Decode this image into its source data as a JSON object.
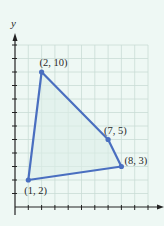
{
  "chart_data": {
    "type": "scatter",
    "title": "",
    "xlabel": "",
    "ylabel": "y",
    "xlim": [
      0,
      10
    ],
    "ylim": [
      0,
      12
    ],
    "grid": true,
    "polygon": true,
    "points": [
      {
        "x": 2,
        "y": 10,
        "label": "(2, 10)"
      },
      {
        "x": 7,
        "y": 5,
        "label": "(7, 5)"
      },
      {
        "x": 8,
        "y": 3,
        "label": "(8, 3)"
      },
      {
        "x": 1,
        "y": 2,
        "label": "(1, 2)"
      }
    ],
    "colors": {
      "line": "#4a6fc0",
      "fill": "#dcefe8",
      "grid": "#c9dcd6",
      "background": "#eef8f4"
    }
  },
  "axes": {
    "y_label": "y"
  }
}
